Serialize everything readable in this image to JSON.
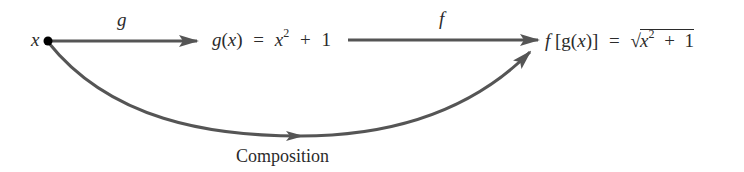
{
  "diagram": {
    "start_label": "x",
    "arrow_g_label": "g",
    "arrow_f_label": "f",
    "middle_expr": {
      "func": "g",
      "var": "x",
      "equals": "=",
      "base": "x",
      "exponent": "2",
      "plus": "+",
      "constant": "1"
    },
    "end_expr": {
      "outer": "f",
      "inner_open": "[",
      "inner_func": "g",
      "var": "x",
      "inner_close": "]",
      "equals": "=",
      "sqrt_symbol": "√",
      "base": "x",
      "exponent": "2",
      "plus": "+",
      "constant": "1"
    },
    "curve_label": "Composition",
    "colors": {
      "arrow": "#555555",
      "text": "#2b2b2b",
      "dot": "#000000"
    }
  }
}
